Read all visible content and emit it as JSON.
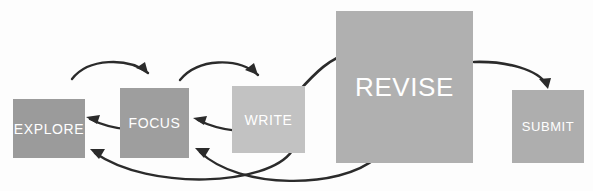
{
  "diagram": {
    "background_color": "#fdfdfd",
    "arrow_color": "#2b2b2b",
    "label_color": "#ffffff",
    "nodes": [
      {
        "id": "explore",
        "label": "EXPLORE",
        "color": "#9b9b9b",
        "x": 13,
        "y": 99,
        "w": 72,
        "h": 59,
        "font_size": 14
      },
      {
        "id": "focus",
        "label": "FOCUS",
        "color": "#9e9e9e",
        "x": 120,
        "y": 88,
        "w": 69,
        "h": 70,
        "font_size": 14
      },
      {
        "id": "write",
        "label": "WRITE",
        "color": "#c2c2c2",
        "x": 232,
        "y": 86,
        "w": 73,
        "h": 67,
        "font_size": 14
      },
      {
        "id": "revise",
        "label": "REVISE",
        "color": "#b0b0b0",
        "x": 336,
        "y": 11,
        "w": 137,
        "h": 152,
        "font_size": 26
      },
      {
        "id": "submit",
        "label": "SUBMIT",
        "color": "#aeaeae",
        "x": 512,
        "y": 90,
        "w": 72,
        "h": 73,
        "font_size": 13
      }
    ],
    "edges": [
      {
        "id": "explore-to-focus",
        "from": "explore",
        "to": "focus",
        "kind": "forward-arc-top",
        "path": "M 72 79 C 88 58, 128 57, 148 73",
        "head": "M 148 73 L 136 68 L 145 62 Z",
        "width": 2.4
      },
      {
        "id": "focus-to-explore",
        "from": "focus",
        "to": "explore",
        "kind": "return-arc",
        "path": "M 168 125 C 140 133, 112 130, 90 119",
        "head": "M 86 117 L 100 115 L 97 124 Z",
        "width": 2.4
      },
      {
        "id": "focus-to-write",
        "from": "focus",
        "to": "write",
        "kind": "forward-arc-top",
        "path": "M 180 80 C 198 58, 238 57, 258 75",
        "head": "M 258 75 L 245 70 L 254 63 Z",
        "width": 2.4
      },
      {
        "id": "write-to-focus",
        "from": "write",
        "to": "focus",
        "kind": "return-arc",
        "path": "M 276 127 C 250 135, 220 131, 198 120",
        "head": "M 193 118 L 207 116 L 204 125 Z",
        "width": 2.4
      },
      {
        "id": "write-to-revise",
        "from": "write",
        "to": "revise",
        "kind": "forward-arc-top",
        "path": "M 298 92 C 316 72, 330 58, 350 53",
        "head": "M 354 52 L 341 47 L 342 57 Z",
        "width": 2.6
      },
      {
        "id": "write-to-explore",
        "from": "write",
        "to": "explore",
        "kind": "long-return-arc",
        "path": "M 292 151 C 268 186, 150 191, 95 153",
        "head": "M 90 149 L 105 149 L 99 159 Z",
        "width": 2.4
      },
      {
        "id": "revise-to-focus",
        "from": "revise",
        "to": "focus",
        "kind": "long-return-arc",
        "path": "M 376 158 C 340 189, 240 190, 200 152",
        "head": "M 195 148 L 210 148 L 204 158 Z",
        "width": 2.4
      },
      {
        "id": "revise-to-submit",
        "from": "revise",
        "to": "submit",
        "kind": "forward-arc-down",
        "path": "M 474 62 C 508 61, 538 70, 546 84",
        "head": "M 548 89 L 539 79 L 551 78 Z",
        "width": 2.6
      }
    ]
  }
}
